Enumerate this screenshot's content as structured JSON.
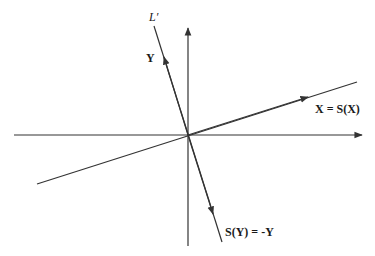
{
  "diagram": {
    "labels": {
      "line_name": "L′",
      "y_vector": "Y",
      "x_equation": "X = S(X)",
      "sy_equation": "S(Y) = -Y"
    },
    "colors": {
      "line": "#333333",
      "text": "#1a1a1a",
      "background": "#ffffff"
    },
    "elements": [
      {
        "name": "horizontal-axis",
        "kind": "axis",
        "arrow": "right"
      },
      {
        "name": "vertical-axis",
        "kind": "axis",
        "arrow": "up"
      },
      {
        "name": "x-line",
        "kind": "line",
        "label": "X = S(X)",
        "arrow": "toward upper-right"
      },
      {
        "name": "l-prime-line",
        "kind": "line",
        "label": "L′",
        "arrows": [
          "Y upward",
          "S(Y) downward"
        ]
      }
    ]
  }
}
